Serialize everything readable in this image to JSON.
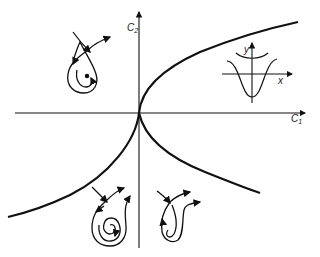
{
  "diagram": {
    "axes": {
      "horizontal_label": "C",
      "horizontal_sub": "1",
      "vertical_label": "C",
      "vertical_sub": "2"
    },
    "inset": {
      "x_label": "x",
      "y_label": "y",
      "description": "potential well with double-well / single-well curves"
    },
    "regions": [
      {
        "name": "upper-left",
        "description": "homoclinic loop with centre point"
      },
      {
        "name": "lower-left",
        "description": "homoclinic loop with spiral"
      },
      {
        "name": "lower-right",
        "description": "loop with spiral, open separatrix"
      }
    ],
    "colors": {
      "line": "#111111",
      "background": "#ffffff"
    }
  }
}
